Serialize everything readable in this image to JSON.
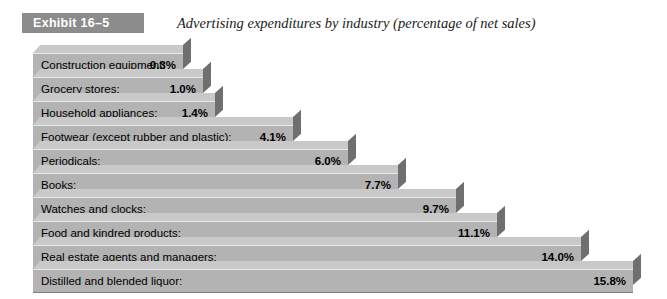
{
  "header": {
    "badge_label": "Exhibit 16–5",
    "title": "Advertising expenditures by industry (percentage of net sales)"
  },
  "colors": {
    "badge_background": "#8c8c8c",
    "badge_text": "#ffffff",
    "bar_front": "#b3b3b3",
    "bar_top": "#c9c9c9",
    "bar_side": "#6f6f6f",
    "page_background": "#ffffff",
    "label_text": "#000000"
  },
  "chart_data": {
    "type": "bar",
    "orientation": "horizontal",
    "title": "Advertising expenditures by industry (percentage of net sales)",
    "xlabel": "",
    "ylabel": "",
    "unit": "%",
    "xlim": [
      0,
      15.8
    ],
    "grid": false,
    "legend": "none",
    "categories": [
      "Construction equipment:",
      "Grocery stores:",
      "Household appliances:",
      "Footwear (except rubber and plastic):",
      "Periodicals:",
      "Books:",
      "Watches and clocks:",
      "Food and kindred products:",
      "Real estate agents and managers:",
      "Distilled and blended liquor:"
    ],
    "values": [
      0.3,
      1.0,
      1.4,
      4.1,
      6.0,
      7.7,
      9.7,
      11.1,
      14.0,
      15.8
    ],
    "value_labels": [
      "0.3%",
      "1.0%",
      "1.4%",
      "4.1%",
      "6.0%",
      "7.7%",
      "9.7%",
      "11.1%",
      "14.0%",
      "15.8%"
    ]
  }
}
